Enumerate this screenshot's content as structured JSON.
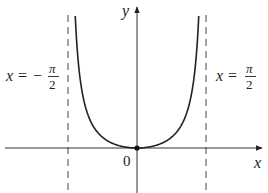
{
  "figure": {
    "axes": {
      "x_label": "x",
      "y_label": "y",
      "origin_label": "0"
    },
    "asymptotes": {
      "left": {
        "lhs": "x",
        "eq": "=",
        "sign": "−",
        "num": "π",
        "den": "2"
      },
      "right": {
        "lhs": "x",
        "eq": "=",
        "num": "π",
        "den": "2"
      }
    },
    "colors": {
      "curve": "#222222",
      "axis": "#333333",
      "asymptote": "#444444",
      "background": "#ffffff"
    }
  }
}
